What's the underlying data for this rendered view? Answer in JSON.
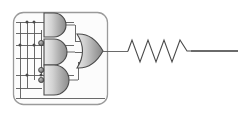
{
  "figure": {
    "kind": "logic-circuit-schematic",
    "width": 249,
    "height": 117,
    "background_color": "#ffffff",
    "title": "",
    "caption": ""
  },
  "colors": {
    "wire": "#5a5a5a",
    "wire_dark": "#3c3c3c",
    "gate_outline": "#4a4a4a",
    "gate_fill_light": "#d8d8d8",
    "gate_fill_mid": "#b4b4b4",
    "gate_fill_dark": "#8f8f8f",
    "bubble_fill": "#6e6e6e",
    "bubble_outline": "#3a3a3a",
    "module_border": "#9a9a9a",
    "module_fill": "#fcfcfc",
    "junction_dot": "#4a4a4a",
    "resistor": "#4a4a4a"
  },
  "module": {
    "name": "logic-module-enclosure",
    "label": "",
    "x": 13,
    "y": 12,
    "width": 95,
    "height": 93,
    "corner_radius": 10,
    "stroke_width": 1.3
  },
  "input_bus": {
    "name": "input-bus",
    "count": 4,
    "orientation": "vertical",
    "lines": [
      {
        "label": "",
        "x": 20,
        "y_top": 22,
        "y_bottom": 98
      },
      {
        "label": "",
        "x": 27,
        "y_top": 22,
        "y_bottom": 98
      },
      {
        "label": "",
        "x": 34,
        "y_top": 22,
        "y_bottom": 98
      },
      {
        "label": "",
        "x": 41,
        "y_top": 22,
        "y_bottom": 98
      }
    ],
    "horizontal_rails": [
      {
        "label": "",
        "y": 22,
        "x_start": 16,
        "x_end": 105
      },
      {
        "label": "",
        "y": 45,
        "x_start": 16,
        "x_end": 105
      },
      {
        "label": "",
        "y": 75,
        "x_start": 16,
        "x_end": 105
      },
      {
        "label": "",
        "y": 98,
        "x_start": 16,
        "x_end": 105
      }
    ]
  },
  "junctions": [
    {
      "name": "junction-dot",
      "x": 27,
      "y": 22
    },
    {
      "name": "junction-dot",
      "x": 34,
      "y": 22
    },
    {
      "name": "junction-dot",
      "x": 20,
      "y": 45
    },
    {
      "name": "junction-dot",
      "x": 34,
      "y": 45
    },
    {
      "name": "junction-dot",
      "x": 27,
      "y": 75
    },
    {
      "name": "junction-dot",
      "x": 41,
      "y": 75
    }
  ],
  "gates": [
    {
      "id": "and-gate-top",
      "type": "AND",
      "label": "",
      "inputs": 2,
      "inverted_inputs": 0,
      "x": 42,
      "y": 13,
      "width": 22,
      "height": 24,
      "output_x": 64,
      "output_y": 25
    },
    {
      "id": "and-gate-middle",
      "type": "AND",
      "label": "",
      "inputs": 2,
      "inverted_inputs": 1,
      "x": 42,
      "y": 38,
      "width": 22,
      "height": 26,
      "output_x": 64,
      "output_y": 51
    },
    {
      "id": "and-gate-bottom",
      "type": "AND",
      "label": "",
      "inputs": 3,
      "inverted_inputs": 2,
      "x": 42,
      "y": 65,
      "width": 22,
      "height": 30,
      "output_x": 64,
      "output_y": 80
    },
    {
      "id": "or-gate-output",
      "type": "OR",
      "label": "",
      "inputs": 3,
      "inverted_inputs": 0,
      "x": 76,
      "y": 34,
      "width": 27,
      "height": 34,
      "output_x": 103,
      "output_y": 51
    }
  ],
  "inversion_bubbles": [
    {
      "name": "inversion-bubble",
      "gate": "and-gate-middle",
      "x": 40,
      "y": 43,
      "r": 2.6
    },
    {
      "name": "inversion-bubble",
      "gate": "and-gate-bottom",
      "x": 40,
      "y": 70,
      "r": 2.6
    },
    {
      "name": "inversion-bubble",
      "gate": "and-gate-bottom",
      "x": 40,
      "y": 80,
      "r": 2.6
    }
  ],
  "output_net": {
    "name": "output-wire",
    "label": "",
    "from_x": 103,
    "to_x": 128,
    "y": 51
  },
  "resistor": {
    "name": "resistor-symbol",
    "label": "",
    "value": "",
    "x_start": 128,
    "x_end": 191,
    "y": 51,
    "amplitude": 11,
    "peaks": 4,
    "lead_right_x": 238
  }
}
